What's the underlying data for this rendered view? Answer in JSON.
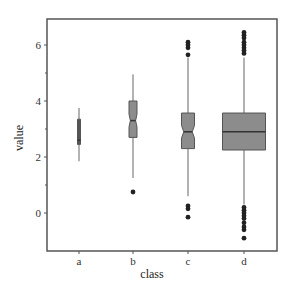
{
  "chart_data": {
    "type": "boxplot",
    "title": "",
    "xlabel": "class",
    "ylabel": "value",
    "categories": [
      "a",
      "b",
      "c",
      "d"
    ],
    "ylim": [
      -1.35,
      6.95
    ],
    "yticks": [
      0,
      2,
      4,
      6
    ],
    "yminor_ticks": [
      1,
      3,
      5
    ],
    "grid": false,
    "notched": true,
    "series": [
      {
        "name": "a",
        "whisker_low": 1.85,
        "q1": 2.45,
        "median": 2.6,
        "q3": 3.35,
        "whisker_high": 3.75,
        "outliers": [],
        "width_px": 3
      },
      {
        "name": "b",
        "whisker_low": 1.25,
        "q1": 2.7,
        "median": 3.3,
        "q3": 4.0,
        "whisker_high": 4.95,
        "outliers": [
          0.75
        ],
        "width_px": 8
      },
      {
        "name": "c",
        "whisker_low": 0.6,
        "q1": 2.3,
        "median": 2.9,
        "q3": 3.57,
        "whisker_high": 5.55,
        "outliers": [
          6.1,
          6.0,
          5.9,
          5.65,
          0.25,
          0.15,
          -0.15
        ],
        "width_px": 13
      },
      {
        "name": "d",
        "whisker_low": 0.3,
        "q1": 2.25,
        "median": 2.9,
        "q3": 3.57,
        "whisker_high": 5.55,
        "outliers": [
          6.45,
          6.35,
          6.25,
          6.1,
          6.0,
          5.9,
          5.8,
          5.7,
          0.2,
          0.1,
          0.0,
          -0.1,
          -0.2,
          -0.35,
          -0.5,
          -0.6,
          -0.9
        ],
        "width_px": 43
      }
    ]
  },
  "colors": {
    "box_fill": "#8c8c8c",
    "box_stroke": "#555555",
    "whisker": "#666666",
    "outlier": "#222222",
    "axis": "#555555"
  }
}
